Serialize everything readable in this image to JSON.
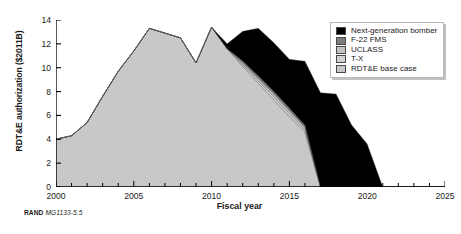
{
  "figure": {
    "caption_prefix": "RAND",
    "caption_id": "MG1133-5.5"
  },
  "legend": {
    "position": "top-right",
    "items": [
      {
        "label": "Next-generation bomber",
        "color": "#000000",
        "swatch_name": "legend-swatch-next-generation-bomber"
      },
      {
        "label": "F-22 FMS",
        "color": "#7d7d7d",
        "swatch_name": "legend-swatch-f-22-fms"
      },
      {
        "label": "UCLASS",
        "color": "#c3c3c3",
        "swatch_name": "legend-swatch-uclass"
      },
      {
        "label": "T-X",
        "color": "#d2d2d2",
        "swatch_name": "legend-swatch-t-x"
      },
      {
        "label": "RDT&E base case",
        "color": "#c8c8c8",
        "swatch_name": "legend-swatch-rdte-base-case"
      }
    ]
  },
  "chart_data": {
    "type": "area",
    "stacked": true,
    "title": "",
    "xlabel": "Fiscal year",
    "ylabel": "RDT&E authorization ($2011B)",
    "xlim": [
      2000,
      2025
    ],
    "ylim": [
      0,
      14
    ],
    "grid": false,
    "xticks": [
      2000,
      2005,
      2010,
      2015,
      2020,
      2025
    ],
    "xtick_labels": [
      "2000",
      "2005",
      "2010",
      "2015",
      "2020",
      "2025"
    ],
    "minor_xtick_step": 1,
    "yticks": [
      0,
      2,
      4,
      6,
      8,
      10,
      12,
      14
    ],
    "ytick_labels": [
      "0",
      "2",
      "4",
      "6",
      "8",
      "10",
      "12",
      "14"
    ],
    "x": [
      2000,
      2001,
      2002,
      2003,
      2004,
      2005,
      2006,
      2007,
      2008,
      2009,
      2010,
      2011,
      2012,
      2013,
      2014,
      2015,
      2016,
      2017,
      2018,
      2019,
      2020,
      2021,
      2022,
      2023,
      2024,
      2025
    ],
    "series": [
      {
        "name": "RDT&E base case",
        "color": "#c8c8c8",
        "values": [
          4.0,
          4.3,
          5.4,
          7.6,
          9.7,
          11.4,
          13.3,
          12.9,
          12.5,
          10.4,
          13.4,
          11.6,
          10.1,
          8.7,
          7.3,
          5.9,
          4.6,
          0.0,
          0.0,
          0.0,
          0.0,
          0.0,
          0.0,
          0.0,
          0.0,
          0.0
        ]
      },
      {
        "name": "T-X",
        "color": "#d2d2d2",
        "values": [
          0.0,
          0.0,
          0.0,
          0.0,
          0.0,
          0.0,
          0.0,
          0.0,
          0.0,
          0.0,
          0.0,
          0.0,
          0.15,
          0.2,
          0.25,
          0.25,
          0.2,
          0.0,
          0.0,
          0.0,
          0.0,
          0.0,
          0.0,
          0.0,
          0.0,
          0.0
        ]
      },
      {
        "name": "UCLASS",
        "color": "#c3c3c3",
        "values": [
          0.0,
          0.0,
          0.0,
          0.0,
          0.0,
          0.0,
          0.0,
          0.0,
          0.0,
          0.0,
          0.0,
          0.0,
          0.15,
          0.2,
          0.25,
          0.25,
          0.2,
          0.0,
          0.0,
          0.0,
          0.0,
          0.0,
          0.0,
          0.0,
          0.0,
          0.0
        ]
      },
      {
        "name": "F-22 FMS",
        "color": "#7d7d7d",
        "values": [
          0.0,
          0.0,
          0.0,
          0.0,
          0.0,
          0.0,
          0.0,
          0.0,
          0.0,
          0.0,
          0.0,
          0.0,
          0.15,
          0.2,
          0.2,
          0.2,
          0.15,
          0.0,
          0.0,
          0.0,
          0.0,
          0.0,
          0.0,
          0.0,
          0.0,
          0.0
        ]
      },
      {
        "name": "Next-generation bomber",
        "color": "#000000",
        "values": [
          0.0,
          0.0,
          0.0,
          0.0,
          0.0,
          0.0,
          0.0,
          0.0,
          0.0,
          0.0,
          0.0,
          0.4,
          2.5,
          4.0,
          4.1,
          4.1,
          5.4,
          7.9,
          7.8,
          5.2,
          3.6,
          0.0,
          0.0,
          0.0,
          0.0,
          0.0
        ]
      }
    ]
  }
}
